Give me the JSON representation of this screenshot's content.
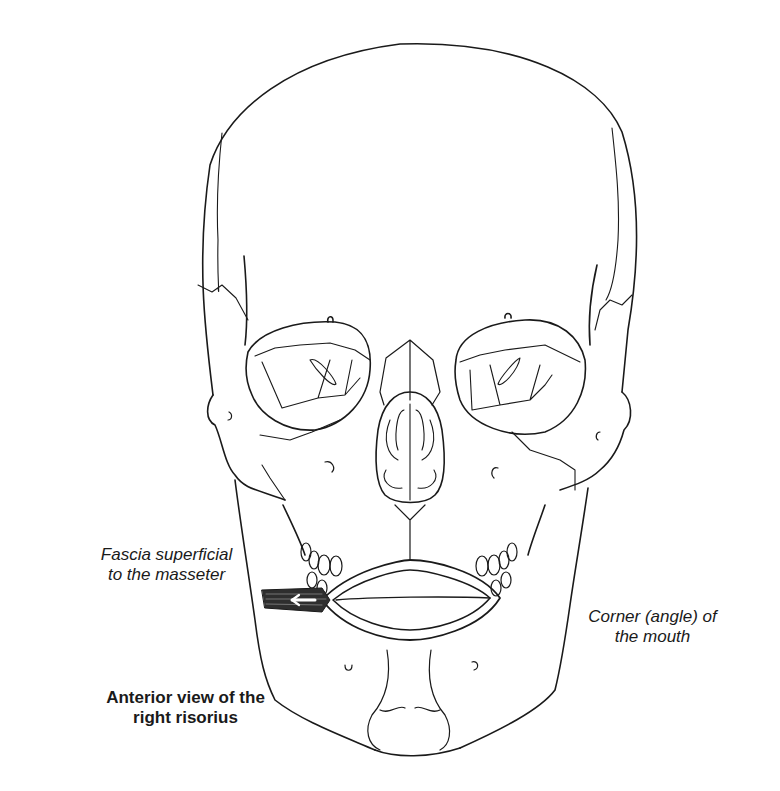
{
  "figure": {
    "colors": {
      "background": "#ffffff",
      "line": "#1a1a1a",
      "muscle": "#3a3a3a",
      "arrow": "#ffffff"
    }
  },
  "labels": {
    "fascia": {
      "line1": "Fascia superficial",
      "line2": "to the masseter"
    },
    "corner": {
      "line1": "Corner (angle) of",
      "line2": "the mouth"
    },
    "caption": {
      "line1": "Anterior view of the",
      "line2": "right risorius"
    }
  },
  "annotations": {
    "arrow_direction": "left",
    "muscle": "risorius"
  }
}
